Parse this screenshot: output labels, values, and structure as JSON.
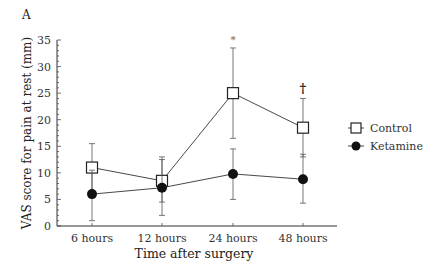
{
  "panel_label": "A",
  "chart_data": {
    "type": "line",
    "title": "",
    "xlabel": "Time after surgery",
    "ylabel": "VAS score for pain at rest (mm)",
    "categories": [
      "6 hours",
      "12 hours",
      "24 hours",
      "48 hours"
    ],
    "ylim": [
      0,
      35
    ],
    "yticks": [
      0,
      5,
      10,
      15,
      20,
      25,
      30,
      35
    ],
    "grid": false,
    "legend_position": "right",
    "series": [
      {
        "name": "Control",
        "marker": "open-square",
        "values": [
          11,
          8.5,
          25,
          18.5
        ],
        "error_low": [
          6.5,
          4.5,
          16.5,
          13
        ],
        "error_high": [
          15.5,
          13,
          33.5,
          24
        ]
      },
      {
        "name": "Ketamine",
        "marker": "filled-circle",
        "values": [
          6,
          7.2,
          9.8,
          8.8
        ],
        "error_low": [
          1,
          2,
          5,
          4.3
        ],
        "error_high": [
          10.5,
          12.5,
          14.5,
          13.5
        ]
      }
    ],
    "annotations": [
      {
        "text": "*",
        "category": "24 hours",
        "y": 35.5
      },
      {
        "text": "†",
        "category": "48 hours",
        "y": 25.8
      }
    ]
  }
}
